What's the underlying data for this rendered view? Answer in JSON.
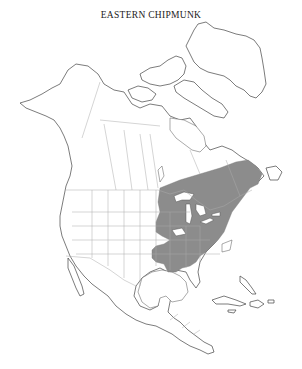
{
  "map": {
    "title": "EASTERN CHIPMUNK",
    "region": "North America",
    "range_fill_color": "#8c8c8c",
    "land_fill_color": "#ffffff",
    "outline_color": "#444444",
    "range_description": "Eastern North America: southern Canada from Manitoba/Ontario east to the Maritimes, south through the eastern United States to the Gulf states"
  }
}
